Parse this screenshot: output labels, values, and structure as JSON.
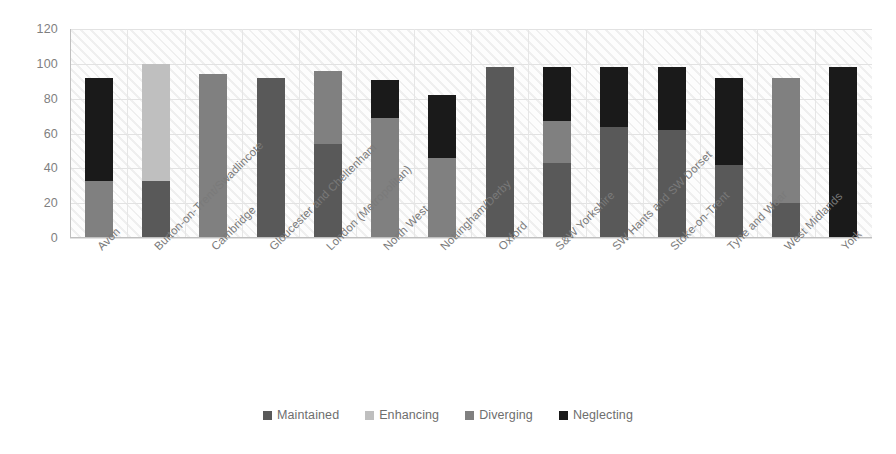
{
  "chart_data": {
    "type": "bar",
    "subtype": "stacked-column",
    "title": "",
    "xlabel": "",
    "ylabel": "",
    "ylim": [
      0,
      120
    ],
    "ytick_labels": [
      "0",
      "20",
      "40",
      "60",
      "80",
      "100",
      "120"
    ],
    "yticks": [
      0,
      20,
      40,
      60,
      80,
      100,
      120
    ],
    "grid": true,
    "legend_position": "bottom",
    "categories": [
      "Avon",
      "Burton-on-Trent/Swadlincote",
      "Cambridge",
      "Gloucester and Cheltenham",
      "London (Metropolitan)",
      "North West",
      "Nottingham/Derby",
      "Oxford",
      "S&W Yorkshire",
      "SW Hants and SW Dorset",
      "Stoke-on-Trent",
      "Tyne and Wear",
      "West Midlands",
      "York"
    ],
    "series": [
      {
        "name": "Maintained",
        "color": "#595959",
        "values": [
          0,
          33,
          0,
          92,
          54,
          0,
          0,
          98,
          43,
          64,
          62,
          42,
          20,
          0
        ]
      },
      {
        "name": "Enhancing",
        "color": "#bfbfbf",
        "values": [
          0,
          67,
          0,
          0,
          0,
          0,
          0,
          0,
          0,
          0,
          0,
          0,
          0,
          0
        ]
      },
      {
        "name": "Diverging",
        "color": "#808080",
        "values": [
          33,
          0,
          94,
          0,
          42,
          69,
          46,
          0,
          24,
          0,
          0,
          0,
          72,
          0
        ]
      },
      {
        "name": "Neglecting",
        "color": "#1a1a1a",
        "values": [
          59,
          0,
          0,
          0,
          0,
          22,
          36,
          0,
          31,
          34,
          36,
          50,
          0,
          98
        ]
      }
    ],
    "totals": [
      92,
      100,
      94,
      92,
      96,
      91,
      82,
      98,
      98,
      98,
      98,
      92,
      92,
      98
    ]
  },
  "legend": {
    "items": [
      {
        "label": "Maintained",
        "color": "#595959"
      },
      {
        "label": "Enhancing",
        "color": "#bfbfbf"
      },
      {
        "label": "Diverging",
        "color": "#808080"
      },
      {
        "label": "Neglecting",
        "color": "#1a1a1a"
      }
    ]
  }
}
